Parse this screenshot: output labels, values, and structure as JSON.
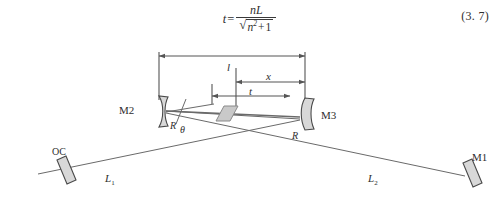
{
  "equation": {
    "lhs": "t",
    "equals": "=",
    "numerator": "nL",
    "denominator_radicand_base": "n",
    "denominator_radicand_exp": "2",
    "denominator_plus": "+",
    "denominator_one": "1",
    "radical_glyph": "√",
    "number": "(3. 7)"
  },
  "figure": {
    "dimensions": [
      {
        "id": "l",
        "label": "l",
        "description": "distance between M2 and M3"
      },
      {
        "id": "x",
        "label": "x",
        "description": "distance from crystal center to M3"
      },
      {
        "id": "t",
        "label": "t",
        "description": "crystal thickness along axis"
      }
    ],
    "mirrors": [
      {
        "id": "oc",
        "label": "OC",
        "type": "flat",
        "radius_label": ""
      },
      {
        "id": "m2",
        "label": "M2",
        "type": "curved",
        "radius_label": "R"
      },
      {
        "id": "m3",
        "label": "M3",
        "type": "curved",
        "radius_label": "R"
      },
      {
        "id": "m1",
        "label": "M1",
        "type": "flat",
        "radius_label": ""
      }
    ],
    "arms": [
      {
        "id": "l1",
        "label": "L",
        "sub": "1"
      },
      {
        "id": "l2",
        "label": "L",
        "sub": "2"
      }
    ],
    "angle": {
      "label": "θ"
    },
    "crystal": {
      "fill": "#c9c9c9",
      "stroke": "#8a8a8a"
    },
    "colors": {
      "line": "#555555",
      "beam": "#6a6a6a",
      "mirror_fill": "#d8d8d8",
      "mirror_stroke": "#4a4a4a",
      "text": "#2e2e2e",
      "background": "#ffffff"
    }
  }
}
